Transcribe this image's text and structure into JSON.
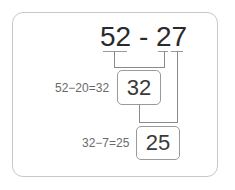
{
  "problem": {
    "expression": "52 - 27",
    "minuend": "52",
    "subtrahend": "27"
  },
  "steps": [
    {
      "equation": "52−20=32",
      "result": "32"
    },
    {
      "equation": "32−7=25",
      "result": "25"
    }
  ],
  "colors": {
    "frame": "#c8c8c8",
    "lines": "#8a8a8a",
    "text": "#2a2a2a",
    "note": "#6a6a6a"
  }
}
